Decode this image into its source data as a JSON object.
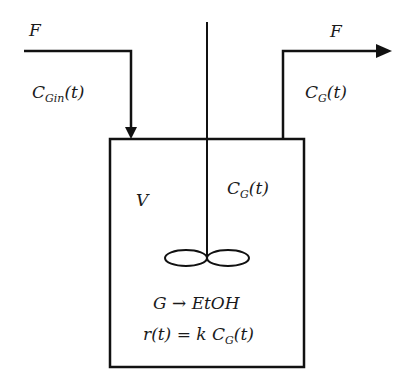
{
  "diagram": {
    "inlet": {
      "flow_label": "F",
      "concentration": {
        "symbol": "C",
        "subscript": "Gin",
        "arg": "(t)"
      }
    },
    "outlet": {
      "flow_label": "F",
      "concentration": {
        "symbol": "C",
        "subscript": "G",
        "arg": "(t)"
      }
    },
    "tank": {
      "volume_label": "V",
      "concentration": {
        "symbol": "C",
        "subscript": "G",
        "arg": "(t)"
      },
      "reaction": "G → EtOH",
      "rate": {
        "lhs": "r(t) = k C",
        "subscript": "G",
        "arg": "(t)"
      }
    },
    "colors": {
      "stroke": "#111111",
      "background": "#ffffff"
    }
  }
}
